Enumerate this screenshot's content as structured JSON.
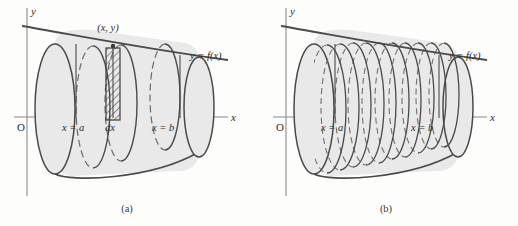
{
  "figure": {
    "background_color": "#fdfdfc",
    "stroke_color": "#4a4a4a",
    "axis_color": "#777777",
    "solid_fill": "#e9e9e9",
    "hatch_color": "#444444",
    "panels": [
      {
        "id": "a",
        "caption": "(a)",
        "axis": {
          "y_axis_label": "y",
          "x_axis_label": "x",
          "origin_label": "O"
        },
        "curve_label": "y = f(x)",
        "point_label": "(x, y)",
        "marks": [
          {
            "name": "left-bound",
            "label": "x = a"
          },
          {
            "name": "shell-thickness",
            "label": "dx"
          },
          {
            "name": "right-bound",
            "label": "x = b"
          }
        ],
        "shell_count": 1,
        "description": "Single cylindrical shell of thickness dx shown hatched inside the solid."
      },
      {
        "id": "b",
        "caption": "(b)",
        "axis": {
          "y_axis_label": "y",
          "x_axis_label": "x",
          "origin_label": "O"
        },
        "curve_label": "y = f(x)",
        "marks": [
          {
            "name": "left-bound",
            "label": "x = a"
          },
          {
            "name": "right-bound",
            "label": "x = b"
          }
        ],
        "shell_count": 11,
        "description": "The solid approximated by many nested cylindrical shells."
      }
    ]
  }
}
